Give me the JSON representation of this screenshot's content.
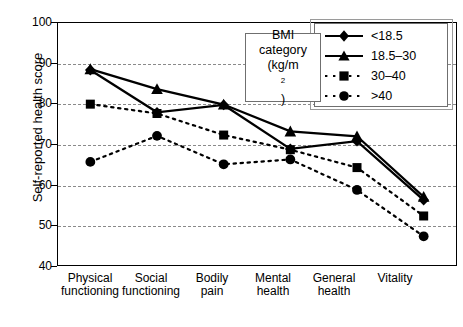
{
  "chart_data": {
    "type": "line",
    "title": "",
    "xlabel": "",
    "ylabel": "Self-reported health score",
    "ylim": [
      40,
      100
    ],
    "ytick_step": 10,
    "yticks": [
      100,
      90,
      80,
      70,
      60,
      50,
      40
    ],
    "grid": true,
    "grid_style": "dashed horizontal",
    "legend_position": "top-right",
    "legend_title_lines": [
      "BMI",
      "category",
      "(kg/m2)"
    ],
    "legend_title_superscript": "2",
    "categories": [
      "Physical functioning",
      "Social functioning",
      "Bodily pain",
      "Mental health",
      "General health",
      "Vitality"
    ],
    "series": [
      {
        "name": "<18.5",
        "marker": "diamond",
        "linestyle": "solid",
        "values": [
          88.2,
          77.8,
          79.6,
          68.8,
          70.7,
          56.2
        ]
      },
      {
        "name": "18.5–30",
        "marker": "triangle",
        "linestyle": "solid",
        "values": [
          88.4,
          83.5,
          79.7,
          73.1,
          71.9,
          57.0
        ]
      },
      {
        "name": "30–40",
        "marker": "square",
        "linestyle": "dotted",
        "values": [
          79.8,
          77.5,
          72.2,
          68.6,
          64.2,
          52.3
        ]
      },
      {
        "name": ">40",
        "marker": "circle",
        "linestyle": "dotted",
        "values": [
          65.6,
          72.0,
          65.0,
          66.2,
          58.7,
          47.3
        ]
      }
    ]
  },
  "axes": {
    "y_title": "Self-reported health score",
    "y_tick_labels": [
      "100",
      "90",
      "80",
      "70",
      "60",
      "50",
      "40"
    ],
    "x_tick_labels": [
      [
        "Physical",
        "functioning"
      ],
      [
        "Social",
        "functioning"
      ],
      [
        "Bodily",
        "pain"
      ],
      [
        "Mental",
        "health"
      ],
      [
        "General",
        "health"
      ],
      [
        "Vitality",
        ""
      ]
    ]
  },
  "legend": {
    "title_line1": "BMI",
    "title_line2": "category",
    "title_line3_prefix": "(kg/m",
    "title_line3_suffix": ")",
    "items": [
      {
        "label": "<18.5"
      },
      {
        "label": "18.5–30"
      },
      {
        "label": "30–40"
      },
      {
        "label": ">40"
      }
    ]
  },
  "colors": {
    "ink": "#000000",
    "grid": "#8a8a8a",
    "frame": "#000000",
    "legend_border": "#6f6f6f",
    "background": "#ffffff"
  }
}
